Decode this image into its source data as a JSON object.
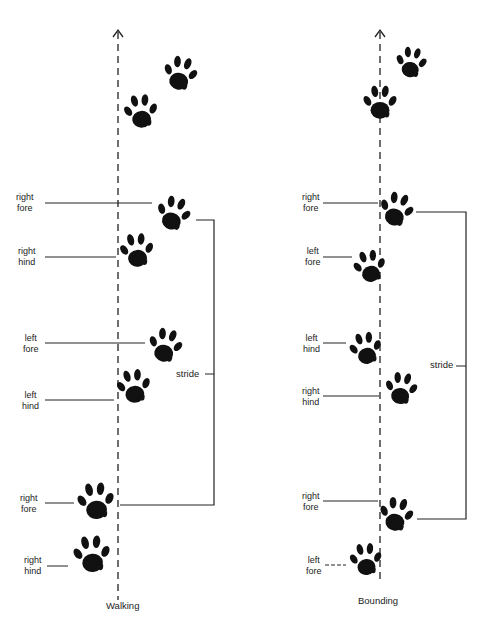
{
  "diagrams": [
    {
      "id": "walking",
      "caption": "Walking",
      "stride_label": "stride",
      "labels": [
        {
          "line1": "right",
          "line2": "fore"
        },
        {
          "line1": "right",
          "line2": "hind"
        },
        {
          "line1": "left",
          "line2": "fore"
        },
        {
          "line1": "left",
          "line2": "hind"
        },
        {
          "line1": "right",
          "line2": "fore"
        },
        {
          "line1": "right",
          "line2": "hind"
        }
      ]
    },
    {
      "id": "bounding",
      "caption": "Bounding",
      "stride_label": "stride",
      "labels": [
        {
          "line1": "right",
          "line2": "fore"
        },
        {
          "line1": "left",
          "line2": "fore"
        },
        {
          "line1": "left",
          "line2": "hind"
        },
        {
          "line1": "right",
          "line2": "hind"
        },
        {
          "line1": "right",
          "line2": "fore"
        },
        {
          "line1": "left",
          "line2": "fore"
        }
      ]
    }
  ],
  "colors": {
    "ink": "#111111",
    "line": "#222222",
    "background": "#ffffff"
  }
}
